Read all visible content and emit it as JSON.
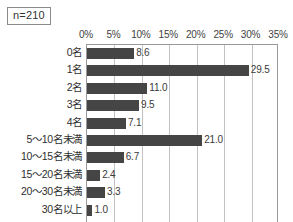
{
  "badge": {
    "label": "n=210"
  },
  "chart_data": {
    "type": "bar",
    "orientation": "horizontal",
    "title": "",
    "subtitle": "",
    "xlabel": "",
    "ylabel": "",
    "xlim": [
      0,
      35
    ],
    "xtick_labels": [
      "0%",
      "5%",
      "10%",
      "15%",
      "20%",
      "25%",
      "30%",
      "35%"
    ],
    "xticks": [
      0,
      5,
      10,
      15,
      20,
      25,
      30,
      35
    ],
    "grid": "vertical",
    "legend": "none",
    "axis_position": "top",
    "categories": [
      "0名",
      "1名",
      "2名",
      "3名",
      "4名",
      "5〜10名未満",
      "10〜15名未満",
      "15〜20名未満",
      "20〜30名未満",
      "30名以上"
    ],
    "values": [
      8.6,
      29.5,
      11.0,
      9.5,
      7.1,
      21.0,
      6.7,
      2.4,
      3.3,
      1.0
    ],
    "value_labels": [
      "8.6",
      "29.5",
      "11.0",
      "9.5",
      "7.1",
      "21.0",
      "6.7",
      "2.4",
      "3.3",
      "1.0"
    ],
    "bar_color": "#454545",
    "gridline_color": "#c2c2c2",
    "axis_color": "#9a9a9a",
    "background": "#ffffff",
    "annotations": [
      "n=210"
    ]
  }
}
